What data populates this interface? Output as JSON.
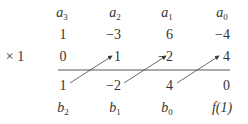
{
  "header": {
    "labels": [
      {
        "var": "a",
        "sub": "3"
      },
      {
        "var": "a",
        "sub": "2"
      },
      {
        "var": "a",
        "sub": "1"
      },
      {
        "var": "a",
        "sub": "0"
      }
    ]
  },
  "coefficients": [
    "1",
    "−3",
    "6",
    "−4"
  ],
  "multiplier": "× 1",
  "products": [
    "0",
    "1",
    "−2",
    "4"
  ],
  "results": [
    "1",
    "−2",
    "4",
    "0"
  ],
  "footer": {
    "labels": [
      {
        "var": "b",
        "sub": "2"
      },
      {
        "var": "b",
        "sub": "1"
      },
      {
        "var": "b",
        "sub": "0"
      },
      {
        "var": "f(1)",
        "sub": ""
      }
    ]
  }
}
